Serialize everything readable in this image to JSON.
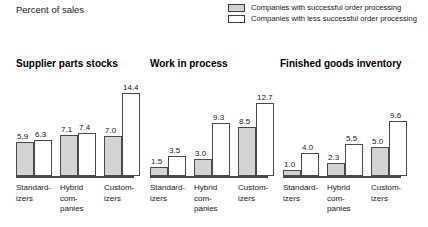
{
  "axis_note": "Percent of sales",
  "legend": {
    "items": [
      {
        "key": "successful",
        "label": "Companies with successful order processing",
        "swatch": "filled",
        "color": "#d4d4d4"
      },
      {
        "key": "less_successful",
        "label": "Companies with less successful order processing",
        "swatch": "empty",
        "color": "#ffffff"
      }
    ]
  },
  "chart_data": {
    "type": "bar",
    "title": "Percent of sales",
    "ylabel": "Percent of sales",
    "xlabel": "",
    "grid": false,
    "legend_position": "top-right",
    "ylim": [
      0,
      15
    ],
    "categories": [
      "Standard-izers",
      "Hybrid com-panies",
      "Customizers"
    ],
    "series": [
      {
        "name": "Companies with successful order processing",
        "color": "#d4d4d4"
      },
      {
        "name": "Companies with less successful order processing",
        "color": "#ffffff"
      }
    ],
    "panels": [
      {
        "title": "Supplier parts stocks",
        "categories": [
          "Standard-izers",
          "Hybrid com-panies",
          "Customizers"
        ],
        "series": [
          {
            "name": "Companies with successful order processing",
            "values": [
              5.9,
              7.1,
              7.0
            ]
          },
          {
            "name": "Companies with less successful order processing",
            "values": [
              6.3,
              7.4,
              14.4
            ]
          }
        ]
      },
      {
        "title": "Work in process",
        "categories": [
          "Standard-izers",
          "Hybrid com-panies",
          "Customizers"
        ],
        "series": [
          {
            "name": "Companies with successful order processing",
            "values": [
              1.5,
              3.0,
              8.5
            ]
          },
          {
            "name": "Companies with less successful order processing",
            "values": [
              3.5,
              9.3,
              12.7
            ]
          }
        ]
      },
      {
        "title": "Finished goods inventory",
        "categories": [
          "Standard-izers",
          "Hybrid com-panies",
          "Customizers"
        ],
        "series": [
          {
            "name": "Companies with successful order processing",
            "values": [
              1.0,
              2.3,
              5.0
            ]
          },
          {
            "name": "Companies with less successful order processing",
            "values": [
              4.0,
              5.5,
              9.6
            ]
          }
        ]
      }
    ]
  },
  "panels_meta": [
    {
      "left": 16,
      "title_left": 16,
      "cat_lines": [
        [
          "Standard-",
          "izers"
        ],
        [
          "Hybrid",
          "com-",
          "panies"
        ],
        [
          "Custom-",
          "izers"
        ]
      ]
    },
    {
      "left": 150,
      "title_left": 150,
      "cat_lines": [
        [
          "Standard-",
          "izers"
        ],
        [
          "Hybrid",
          "com-",
          "panies"
        ],
        [
          "Custom-",
          "izers"
        ]
      ]
    },
    {
      "left": 283,
      "title_left": 280,
      "cat_lines": [
        [
          "Standard-",
          "izers"
        ],
        [
          "Hybrid",
          "com-",
          "panies"
        ],
        [
          "Custom-",
          "izers"
        ]
      ]
    }
  ],
  "layout": {
    "baseline_y": 178,
    "px_per_unit": 5.75,
    "bar_width": 18,
    "group_pitch": 44,
    "axis_width": 118
  }
}
